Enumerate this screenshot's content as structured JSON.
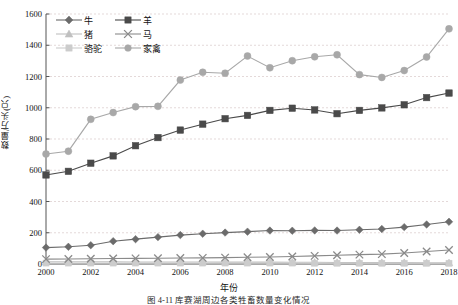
{
  "chart_data": {
    "type": "line",
    "title": "",
    "xlabel": "年份",
    "ylabel": "数量/万头(只)",
    "ylim": [
      0,
      1600
    ],
    "ytick_step": 200,
    "yticks": [
      0,
      200,
      400,
      600,
      800,
      1000,
      1200,
      1400,
      1600
    ],
    "xlim": [
      2000,
      2018
    ],
    "x": [
      2000,
      2001,
      2002,
      2003,
      2004,
      2005,
      2006,
      2007,
      2008,
      2009,
      2010,
      2011,
      2012,
      2013,
      2014,
      2015,
      2016,
      2017,
      2018
    ],
    "xticks": [
      2000,
      2002,
      2004,
      2006,
      2008,
      2010,
      2012,
      2014,
      2016,
      2018
    ],
    "xtick_labels": [
      "2000",
      "2002",
      "2004",
      "2006",
      "2008",
      "2010",
      "2012",
      "2014",
      "2016",
      "2018"
    ],
    "grid": true,
    "grid_axis": "y",
    "legend_position": "top-left",
    "series": [
      {
        "name": "牛",
        "marker": "diamond",
        "color": "#6b6b6b",
        "values": [
          105,
          110,
          120,
          146,
          159,
          172,
          185,
          194,
          201,
          207,
          214,
          213,
          215,
          214,
          219,
          224,
          236,
          253,
          270
        ]
      },
      {
        "name": "羊",
        "marker": "square",
        "color": "#4a4a4a",
        "values": [
          570,
          593,
          645,
          692,
          757,
          809,
          857,
          895,
          930,
          951,
          983,
          997,
          986,
          962,
          983,
          999,
          1019,
          1065,
          1094
        ]
      },
      {
        "name": "猪",
        "marker": "triangle",
        "color": "#c0c0c0",
        "values": [
          14,
          14,
          14,
          14,
          13,
          13,
          13,
          13,
          12,
          12,
          12,
          11,
          11,
          10,
          10,
          9,
          9,
          8,
          8
        ]
      },
      {
        "name": "马",
        "marker": "x",
        "color": "#8a8a8a",
        "values": [
          31,
          32,
          34,
          35,
          36,
          37,
          38,
          39,
          41,
          43,
          45,
          48,
          52,
          56,
          60,
          63,
          70,
          80,
          90
        ]
      },
      {
        "name": "骆驼",
        "marker": "square-light",
        "color": "#cccccc",
        "values": [
          6,
          6,
          6,
          6,
          6,
          6,
          6,
          6,
          6,
          6,
          6,
          6,
          5,
          5,
          5,
          5,
          5,
          5,
          5
        ]
      },
      {
        "name": "家禽",
        "marker": "circle",
        "color": "#a8a8a8",
        "values": [
          704,
          722,
          926,
          969,
          1007,
          1009,
          1177,
          1227,
          1221,
          1331,
          1256,
          1301,
          1326,
          1339,
          1212,
          1194,
          1238,
          1325,
          1505
        ]
      }
    ]
  },
  "caption": "图 4-11  库赛湖周边各类牲畜数量变化情况"
}
